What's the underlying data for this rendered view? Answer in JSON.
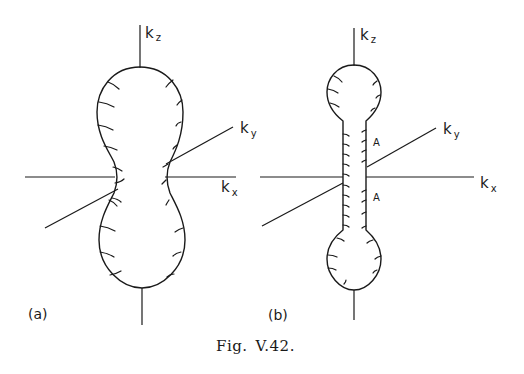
{
  "figure": {
    "caption_prefix": "Fig.",
    "caption_number": "V.42."
  },
  "panel_a": {
    "label": "(a)",
    "axes": {
      "kz": {
        "letter": "k",
        "sub": "z"
      },
      "ky": {
        "letter": "k",
        "sub": "y"
      },
      "kx": {
        "letter": "k",
        "sub": "x"
      }
    },
    "shape": "dumbbell surface with broad waist"
  },
  "panel_b": {
    "label": "(b)",
    "axes": {
      "kz": {
        "letter": "k",
        "sub": "z"
      },
      "ky": {
        "letter": "k",
        "sub": "y"
      },
      "kx": {
        "letter": "k",
        "sub": "x"
      }
    },
    "neck_labels": [
      "A",
      "A"
    ],
    "shape": "dumbbell surface with narrow cylindrical neck"
  }
}
